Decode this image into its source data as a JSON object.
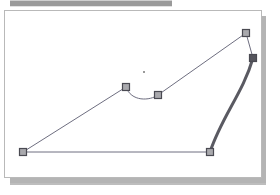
{
  "window": {
    "title": "Vector Path Editor",
    "toolbar_label": "toolbar-strip"
  },
  "canvas": {
    "label": "drawing-canvas",
    "background_color": "#ffffff",
    "border_color": "#b9b9b9",
    "shadow_color": "#b4b4b4",
    "width": 258,
    "height": 168
  },
  "style": {
    "thin_stroke_color": "#6e6e80",
    "thin_stroke_width": 1,
    "thick_stroke_color": "#5a5a62",
    "thick_stroke_width": 3,
    "handle_fill": "#a9a9ad",
    "handle_border": "#4a4a52",
    "handle_selected_fill": "#55555d",
    "handle_size": 7,
    "toolbar_color": "#9a9a9a"
  },
  "path": {
    "name": "editable-path",
    "closed": true,
    "nodes": [
      {
        "id": "n1",
        "name": "anchor-bottom-left",
        "x": 23,
        "y": 152,
        "selected": false
      },
      {
        "id": "n2",
        "name": "anchor-mid-peak",
        "x": 126,
        "y": 87,
        "selected": false
      },
      {
        "id": "n3",
        "name": "anchor-mid-valley",
        "x": 158,
        "y": 95,
        "selected": false
      },
      {
        "id": "n4",
        "name": "anchor-top-right",
        "x": 246,
        "y": 33,
        "selected": false
      },
      {
        "id": "n5",
        "name": "anchor-right",
        "x": 253,
        "y": 58,
        "selected": true
      },
      {
        "id": "n6",
        "name": "anchor-bottom-right",
        "x": 210,
        "y": 152,
        "selected": false
      }
    ],
    "segments": [
      {
        "name": "segment-left-diagonal",
        "type": "line",
        "from": "n1",
        "to": "n2",
        "weight": "thin"
      },
      {
        "name": "segment-arc-dip",
        "type": "curve",
        "from": "n2",
        "to": "n3",
        "weight": "thin",
        "d": "M 126 87 C 131 102 150 101 158 95"
      },
      {
        "name": "segment-right-diagonal",
        "type": "line",
        "from": "n3",
        "to": "n4",
        "weight": "thin"
      },
      {
        "name": "segment-short-link",
        "type": "line",
        "from": "n4",
        "to": "n5",
        "weight": "thin"
      },
      {
        "name": "segment-right-bow",
        "type": "curve",
        "from": "n5",
        "to": "n6",
        "weight": "thick",
        "d": "M 253 58 C 243 93 222 116 210 152"
      },
      {
        "name": "segment-baseline",
        "type": "line",
        "from": "n6",
        "to": "n1",
        "weight": "thin"
      }
    ],
    "marker": {
      "name": "reference-point",
      "x": 144,
      "y": 72,
      "size": 2,
      "color": "#9a9a9a"
    }
  }
}
